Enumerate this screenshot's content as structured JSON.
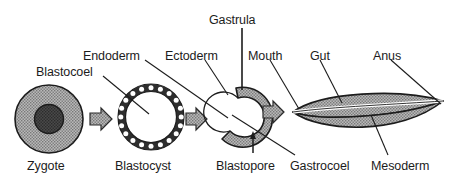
{
  "figure": {
    "background_color": "#ffffff",
    "text_color": "#1c1c1c",
    "structure_fill": "#9a9a9a",
    "structure_stroke": "#1c1c1c",
    "arrow_fill": "#9a9a9a",
    "cavity_fill": "#ffffff"
  },
  "stages": [
    {
      "id": "zygote",
      "label": "Zygote",
      "shape": "filled-circle-with-nucleus"
    },
    {
      "id": "blastocyst",
      "label": "Blastocyst",
      "shape": "hollow-cell-ring"
    },
    {
      "id": "gastrula",
      "label": "Gastrula",
      "shape": "crescent-with-blastopore"
    },
    {
      "id": "larva",
      "label": "",
      "shape": "lens-with-gut-channel"
    }
  ],
  "labels": {
    "blastocoel": "Blastocoel",
    "endoderm": "Endoderm",
    "ectoderm": "Ectoderm",
    "gastrula": "Gastrula",
    "mouth": "Mouth",
    "gut": "Gut",
    "anus": "Anus",
    "zygote": "Zygote",
    "blastocyst": "Blastocyst",
    "blastopore": "Blastopore",
    "gastrocoel": "Gastrocoel",
    "mesoderm": "Mesoderm"
  },
  "transitions": [
    {
      "from": "zygote",
      "to": "blastocyst",
      "glyph": "block-arrow-right"
    },
    {
      "from": "blastocyst",
      "to": "gastrula",
      "glyph": "block-arrow-right"
    },
    {
      "from": "gastrula",
      "to": "larva",
      "glyph": "block-arrow-right"
    }
  ]
}
